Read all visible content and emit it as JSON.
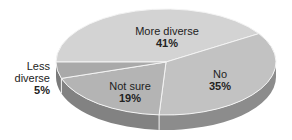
{
  "chart_data": {
    "type": "pie",
    "title": "",
    "style": "3d",
    "categories": [
      "More diverse",
      "No",
      "Not sure",
      "Less diverse"
    ],
    "values": [
      41,
      35,
      19,
      5
    ],
    "labels": [
      {
        "name": "More diverse",
        "pct": "41%"
      },
      {
        "name": "No",
        "pct": "35%"
      },
      {
        "name": "Not sure",
        "pct": "19%"
      },
      {
        "name": "Less diverse",
        "pct": "5%"
      }
    ],
    "colors": {
      "More diverse": "#d3d3d3",
      "No": "#c2c2c2",
      "Not sure": "#b4b4b4",
      "Less diverse": "#a9a9a9"
    },
    "legend": "none"
  }
}
